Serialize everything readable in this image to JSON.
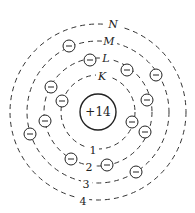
{
  "diagram": {
    "nucleus": {
      "label": "+14",
      "cx": 98,
      "cy": 112,
      "r": 18
    },
    "shells": [
      {
        "letter": "K",
        "number": "1",
        "r": 37,
        "letter_pos": [
          102,
          80
        ],
        "number_pos": [
          93,
          153
        ]
      },
      {
        "letter": "L",
        "number": "2",
        "r": 54,
        "letter_pos": [
          106,
          62
        ],
        "number_pos": [
          89,
          170
        ]
      },
      {
        "letter": "M",
        "number": "3",
        "r": 71,
        "letter_pos": [
          109,
          45
        ],
        "number_pos": [
          86,
          187
        ]
      },
      {
        "letter": "N",
        "number": "4",
        "r": 88,
        "letter_pos": [
          113,
          28
        ],
        "number_pos": [
          83,
          204
        ]
      }
    ],
    "electron_symbol": "−",
    "electrons": [
      [
        69,
        46
      ],
      [
        90,
        60
      ],
      [
        127,
        70
      ],
      [
        156,
        75
      ],
      [
        51,
        87
      ],
      [
        62,
        101
      ],
      [
        147,
        100
      ],
      [
        45,
        121
      ],
      [
        30,
        134
      ],
      [
        132,
        122
      ],
      [
        145,
        132
      ],
      [
        71,
        159
      ],
      [
        107,
        165
      ],
      [
        136,
        172
      ]
    ]
  },
  "text": {
    "nucleus_label": "+14",
    "shell_K": "K",
    "shell_L": "L",
    "shell_M": "M",
    "shell_N": "N",
    "shell_1": "1",
    "shell_2": "2",
    "shell_3": "3",
    "shell_4": "4"
  }
}
